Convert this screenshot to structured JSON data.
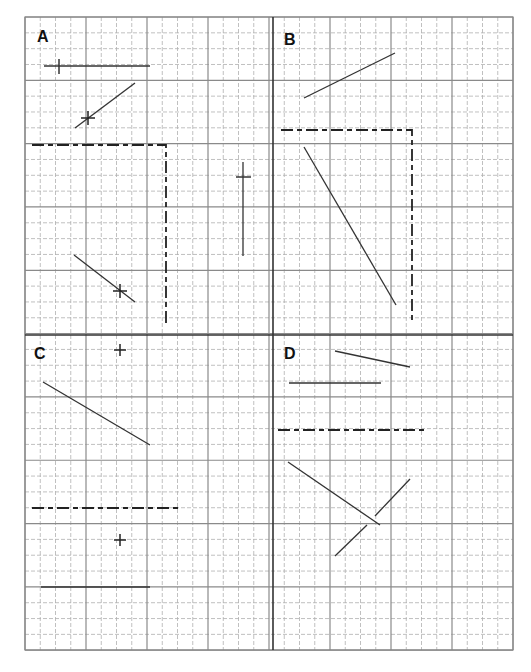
{
  "figure": {
    "grid": {
      "left": 25,
      "top": 17,
      "right": 513,
      "bottom": 650,
      "minor_step_x": 15.25,
      "minor_step_y": 15.83,
      "major_every": 4,
      "center_x": 273,
      "center_y": 335,
      "minor_color": "#b0b0b0",
      "major_color": "#8a8a8a",
      "divider_color": "#333333"
    },
    "quadrants": [
      {
        "label": "A",
        "label_x": 37,
        "label_y": 42
      },
      {
        "label": "B",
        "label_x": 284,
        "label_y": 45
      },
      {
        "label": "C",
        "label_x": 34,
        "label_y": 359
      },
      {
        "label": "D",
        "label_x": 284,
        "label_y": 359
      }
    ],
    "solid_lines": [
      {
        "quadrant": "A",
        "x1": 44,
        "y1": 66,
        "x2": 150,
        "y2": 66
      },
      {
        "quadrant": "A",
        "x1": 75,
        "y1": 128,
        "x2": 135,
        "y2": 83
      },
      {
        "quadrant": "A",
        "x1": 74,
        "y1": 255,
        "x2": 135,
        "y2": 302
      },
      {
        "quadrant": "A",
        "x1": 243,
        "y1": 162,
        "x2": 243,
        "y2": 256
      },
      {
        "quadrant": "B",
        "x1": 304,
        "y1": 98,
        "x2": 395,
        "y2": 53
      },
      {
        "quadrant": "B",
        "x1": 304,
        "y1": 147,
        "x2": 396,
        "y2": 305
      },
      {
        "quadrant": "C",
        "x1": 43,
        "y1": 382,
        "x2": 150,
        "y2": 445
      },
      {
        "quadrant": "C",
        "x1": 41,
        "y1": 587,
        "x2": 150,
        "y2": 587
      },
      {
        "quadrant": "D",
        "x1": 335,
        "y1": 351,
        "x2": 410,
        "y2": 367
      },
      {
        "quadrant": "D",
        "x1": 289,
        "y1": 383,
        "x2": 381,
        "y2": 383
      },
      {
        "quadrant": "D",
        "x1": 288,
        "y1": 462,
        "x2": 380,
        "y2": 525
      },
      {
        "quadrant": "D",
        "x1": 375,
        "y1": 516,
        "x2": 410,
        "y2": 479
      },
      {
        "quadrant": "D",
        "x1": 335,
        "y1": 556,
        "x2": 367,
        "y2": 525
      }
    ],
    "dashed_lines": [
      {
        "quadrant": "A",
        "points": "32,145 166,145 166,324"
      },
      {
        "quadrant": "B",
        "points": "281,130 412,130 412,324"
      },
      {
        "quadrant": "C",
        "points": "32,508 181,508"
      },
      {
        "quadrant": "D",
        "points": "278,430 427,430"
      }
    ],
    "tick_marks": [
      {
        "quadrant": "A",
        "x1": 59,
        "y1": 59,
        "x2": 59,
        "y2": 74
      },
      {
        "quadrant": "A",
        "x1": 236,
        "y1": 177,
        "x2": 251,
        "y2": 177
      }
    ],
    "plus_marks": [
      {
        "quadrant": "A",
        "x": 88,
        "y": 118,
        "size": 7
      },
      {
        "quadrant": "A",
        "x": 120,
        "y": 291,
        "size": 7
      },
      {
        "quadrant": "C",
        "x": 120,
        "y": 350,
        "size": 6
      },
      {
        "quadrant": "C",
        "x": 120,
        "y": 540,
        "size": 6
      }
    ]
  }
}
